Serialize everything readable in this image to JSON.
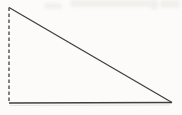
{
  "figure": {
    "type": "right-triangle",
    "canvas": {
      "width": 182,
      "height": 115
    },
    "vertices": {
      "apex_top_left": [
        9,
        7.5
      ],
      "bottom_left": [
        9,
        103
      ],
      "bottom_right": [
        172,
        102.5
      ]
    },
    "sides": [
      {
        "name": "left-vertical-leg",
        "style": "dashed",
        "path": "M 9 7.5 L 9 103",
        "dash": "3.5,2.5"
      },
      {
        "name": "bottom-base",
        "style": "solid",
        "path": "M 9 103 L 172 102.5",
        "dash": "none"
      },
      {
        "name": "hypotenuse",
        "style": "solid",
        "path": "M 9 7.5 L 172 102.5",
        "dash": "none"
      }
    ],
    "scan_echo_path": "M 10 105.5 L 170 105"
  },
  "colors": {
    "bg-color": "#fcfbf9",
    "line-color": "#3f3f3f",
    "echo-color": "#d9d6d2",
    "bleed-color": "#f1efec"
  }
}
